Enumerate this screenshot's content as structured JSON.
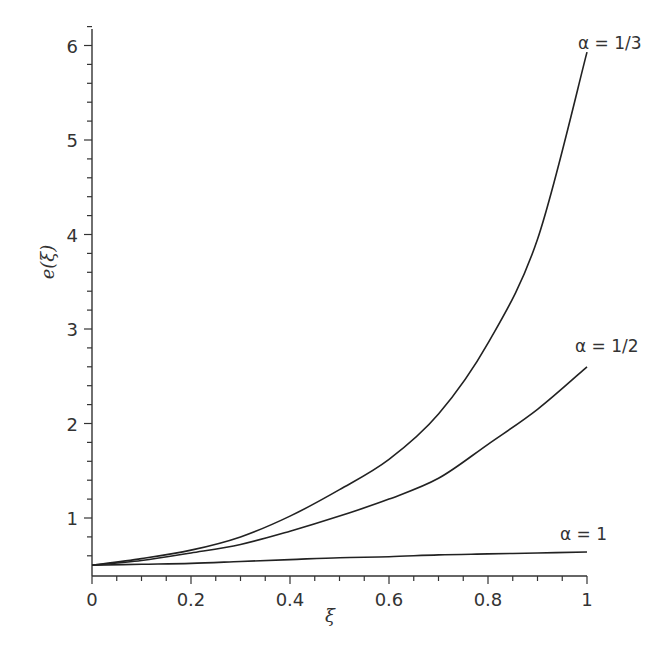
{
  "chart_data": {
    "type": "line",
    "title": "",
    "xlabel": "ξ",
    "ylabel": "e(ξ)",
    "xlim": [
      0,
      1
    ],
    "ylim": [
      0.4,
      6.2
    ],
    "grid": false,
    "legend": "inline labels at curve ends",
    "x_ticks": [
      0,
      0.2,
      0.4,
      0.6,
      0.8,
      1
    ],
    "x_tick_labels": [
      "0",
      "0.2",
      "0.4",
      "0.6",
      "0.8",
      "1"
    ],
    "y_ticks": [
      1,
      2,
      3,
      4,
      5,
      6
    ],
    "y_tick_labels": [
      "1",
      "2",
      "3",
      "4",
      "5",
      "6"
    ],
    "x": [
      0,
      0.1,
      0.2,
      0.3,
      0.4,
      0.5,
      0.6,
      0.7,
      0.8,
      0.9,
      1.0
    ],
    "series": [
      {
        "name": "α = 1/3",
        "values": [
          0.5,
          0.57,
          0.66,
          0.8,
          1.02,
          1.3,
          1.62,
          2.1,
          2.85,
          3.95,
          5.93
        ]
      },
      {
        "name": "α = 1/2",
        "values": [
          0.5,
          0.55,
          0.63,
          0.72,
          0.86,
          1.02,
          1.2,
          1.42,
          1.78,
          2.15,
          2.6
        ]
      },
      {
        "name": "α = 1",
        "values": [
          0.5,
          0.51,
          0.52,
          0.54,
          0.56,
          0.58,
          0.59,
          0.61,
          0.62,
          0.63,
          0.64
        ]
      }
    ]
  }
}
